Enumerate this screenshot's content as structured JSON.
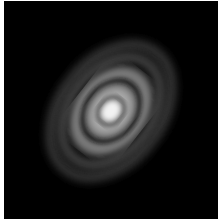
{
  "image": {
    "subject": "concentric elliptical rings around bright central core",
    "colors": {
      "background": "#000000",
      "border": "#ffffff",
      "core": "#f4f4f4",
      "ring_glow": "#9a9a9a",
      "outer_halo": "#3a3a3a"
    },
    "center": [
      107,
      110
    ],
    "tilt_deg": -48,
    "rings": [
      {
        "rx": 10,
        "ry": 8,
        "brightness": 1.0
      },
      {
        "rx": 24,
        "ry": 18,
        "brightness": 0.75
      },
      {
        "rx": 38,
        "ry": 28,
        "brightness": 0.45
      },
      {
        "rx": 58,
        "ry": 40,
        "brightness": 0.22
      },
      {
        "rx": 74,
        "ry": 50,
        "brightness": 0.12
      }
    ]
  }
}
